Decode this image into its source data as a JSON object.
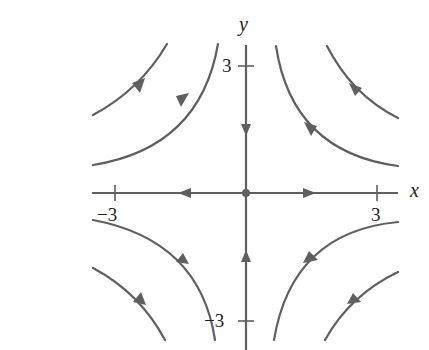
{
  "diagram": {
    "type": "phase-portrait",
    "colors": {
      "stroke": "#5f5f5f",
      "text": "#222222",
      "background": "#ffffff"
    },
    "axes": {
      "x_label": "x",
      "y_label": "y",
      "x_ticks": [
        {
          "value": -3,
          "label": "−3"
        },
        {
          "value": 3,
          "label": "3"
        }
      ],
      "y_ticks": [
        {
          "value": 3,
          "label": "3"
        },
        {
          "value": -3,
          "label": "−3"
        }
      ]
    },
    "equilibrium": {
      "x": 0,
      "y": 0,
      "kind": "saddle"
    },
    "axis_flows": {
      "positive_y_axis": "toward origin",
      "negative_y_axis": "toward origin",
      "negative_x_axis": "away from origin",
      "positive_x_axis": "away from origin"
    },
    "trajectories": [
      {
        "quadrant": "II",
        "name": "inner",
        "direction": "down-left"
      },
      {
        "quadrant": "II",
        "name": "outer",
        "direction": "down-left"
      },
      {
        "quadrant": "I",
        "name": "inner",
        "direction": "down-right"
      },
      {
        "quadrant": "I",
        "name": "outer",
        "direction": "down-right"
      },
      {
        "quadrant": "III",
        "name": "outer",
        "direction": "up-left"
      },
      {
        "quadrant": "III",
        "name": "inner",
        "direction": "up-left"
      },
      {
        "quadrant": "IV",
        "name": "outer",
        "direction": "up-right"
      },
      {
        "quadrant": "IV",
        "name": "inner",
        "direction": "up-right"
      }
    ]
  }
}
